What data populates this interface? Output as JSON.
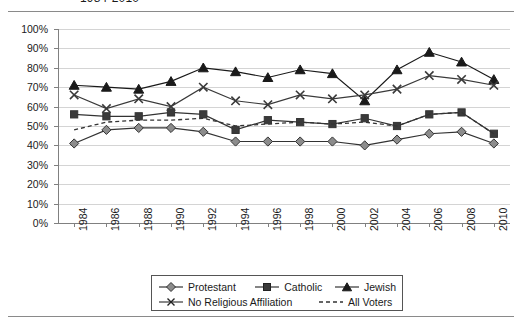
{
  "title": "1984-2010",
  "chart_data": {
    "type": "line",
    "title": "1984-2010",
    "xlabel": "",
    "ylabel": "",
    "ylim": [
      0,
      100
    ],
    "ytick_labels": [
      "100%",
      "90%",
      "80%",
      "70%",
      "60%",
      "50%",
      "40%",
      "30%",
      "20%",
      "10%",
      "0%"
    ],
    "ytick_values": [
      100,
      90,
      80,
      70,
      60,
      50,
      40,
      30,
      20,
      10,
      0
    ],
    "grid": true,
    "legend_position": "bottom",
    "categories": [
      "1984",
      "1986",
      "1988",
      "1990",
      "1992",
      "1994",
      "1996",
      "1998",
      "2000",
      "2002",
      "2004",
      "2006",
      "2008",
      "2010"
    ],
    "x": [
      1984,
      1986,
      1988,
      1990,
      1992,
      1994,
      1996,
      1998,
      2000,
      2002,
      2004,
      2006,
      2008,
      2010
    ],
    "series": [
      {
        "name": "Protestant",
        "marker": "diamond",
        "line": "solid",
        "color": "#333333",
        "marker_fill": "#8c8c8c",
        "values": [
          41,
          48,
          49,
          49,
          47,
          42,
          42,
          42,
          42,
          40,
          43,
          46,
          47,
          41
        ]
      },
      {
        "name": "Catholic",
        "marker": "square",
        "line": "solid",
        "color": "#333333",
        "marker_fill": "#3a3a3a",
        "values": [
          56,
          55,
          55,
          57,
          56,
          48,
          53,
          52,
          51,
          54,
          50,
          56,
          57,
          46
        ]
      },
      {
        "name": "Jewish",
        "marker": "triangle",
        "line": "solid",
        "color": "#1a1a1a",
        "marker_fill": "#1a1a1a",
        "values": [
          71,
          70,
          69,
          73,
          80,
          78,
          75,
          79,
          77,
          63,
          79,
          88,
          83,
          74
        ]
      },
      {
        "name": "No Religious Affiliation",
        "marker": "x",
        "line": "solid",
        "color": "#3a3a3a",
        "marker_fill": "none",
        "values": [
          66,
          59,
          64,
          60,
          70,
          63,
          61,
          66,
          64,
          66,
          69,
          76,
          74,
          71
        ]
      },
      {
        "name": "All Voters",
        "marker": "none",
        "line": "dashed",
        "color": "#333333",
        "marker_fill": "none",
        "values": [
          48,
          52,
          53,
          53,
          54,
          50,
          51,
          52,
          51,
          52,
          50,
          56,
          57,
          46
        ]
      }
    ]
  },
  "legend": {
    "items": [
      {
        "label": "Protestant",
        "marker": "diamond"
      },
      {
        "label": "Catholic",
        "marker": "square"
      },
      {
        "label": "Jewish",
        "marker": "triangle"
      },
      {
        "label": "No Religious Affiliation",
        "marker": "x"
      },
      {
        "label": "All Voters",
        "marker": "dashed-line"
      }
    ]
  }
}
